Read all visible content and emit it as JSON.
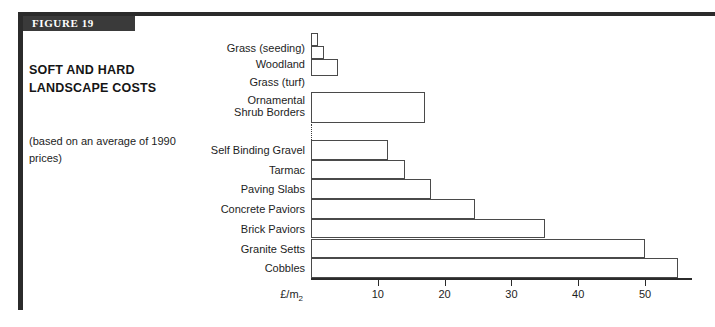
{
  "figure": {
    "banner_label": "FIGURE 19",
    "title": "SOFT AND HARD LANDSCAPE COSTS",
    "subtitle": "(based on an average of 1990 prices)"
  },
  "colors": {
    "frame": "#2b2b2b",
    "banner_bg": "#3a3a3a",
    "banner_text": "#ffffff",
    "bar_stroke": "#4a4a4a",
    "bar_fill": "#ffffff",
    "text": "#1d1d1d"
  },
  "chart_data": {
    "type": "bar",
    "orientation": "horizontal",
    "title": "SOFT AND HARD LANDSCAPE COSTS",
    "subtitle": "(based on an average of 1990 prices)",
    "xlabel": "£/m2",
    "ylabel": "",
    "xlim": [
      0,
      57
    ],
    "ticks": [
      10,
      20,
      30,
      40,
      50
    ],
    "grid": false,
    "legend": false,
    "groups": [
      {
        "name": "soft landscape",
        "categories": [
          "Grass (seeding)",
          "Woodland",
          "Grass (turf)",
          "Ornamental Shrub Borders"
        ],
        "values": [
          1,
          2,
          4,
          17
        ]
      },
      {
        "name": "hard landscape",
        "categories": [
          "Self Binding Gravel",
          "Tarmac",
          "Paving Slabs",
          "Concrete Paviors",
          "Brick Paviors",
          "Granite Setts",
          "Cobbles"
        ],
        "values": [
          11.5,
          14,
          18,
          24.5,
          35,
          50,
          55
        ]
      }
    ],
    "categories": [
      "Grass (seeding)",
      "Woodland",
      "Grass (turf)",
      "Ornamental Shrub Borders",
      "Self Binding Gravel",
      "Tarmac",
      "Paving Slabs",
      "Concrete Paviors",
      "Brick Paviors",
      "Granite Setts",
      "Cobbles"
    ],
    "values": [
      1,
      2,
      4,
      17,
      11.5,
      14,
      18,
      24.5,
      35,
      50,
      55
    ]
  }
}
